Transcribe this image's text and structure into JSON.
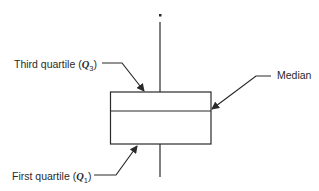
{
  "diagram": {
    "type": "box-plot-annotated",
    "labels": {
      "third_quartile": {
        "text": "Third quartile (",
        "symbol": "Q",
        "subscript": "3",
        "close": ")"
      },
      "median": {
        "text": "Median"
      },
      "first_quartile": {
        "text": "First quartile (",
        "symbol": "Q",
        "subscript": "1",
        "close": ")"
      }
    },
    "elements": [
      "outlier-point",
      "upper-whisker",
      "box",
      "median-line",
      "lower-whisker"
    ],
    "colors": {
      "stroke": "#2a2a2a",
      "background": "#ffffff"
    }
  }
}
